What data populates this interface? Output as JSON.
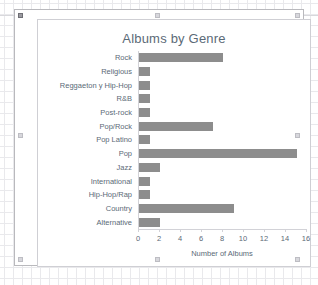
{
  "chart_data": {
    "type": "bar",
    "orientation": "horizontal",
    "title": "Albums by Genre",
    "xlabel": "Number of Albums",
    "ylabel": "",
    "categories": [
      "Rock",
      "Religious",
      "Reggaeton y Hip-Hop",
      "R&B",
      "Post-rock",
      "Pop/Rock",
      "Pop Latino",
      "Pop",
      "Jazz",
      "International",
      "Hip-Hop/Rap",
      "Country",
      "Alternative"
    ],
    "values": [
      8,
      1,
      1,
      1,
      1,
      7,
      1,
      15,
      2,
      1,
      1,
      9,
      2
    ],
    "xticks": [
      "0",
      "2",
      "4",
      "6",
      "8",
      "10",
      "12",
      "14",
      "16"
    ],
    "xtick_values": [
      0,
      2,
      4,
      6,
      8,
      10,
      12,
      14,
      16
    ],
    "xlim": [
      0,
      16
    ],
    "grid": false,
    "legend": false,
    "bar_color": "#8d8d8d",
    "text_color": "#5b6a77",
    "axis_color": "#d2d2d7"
  },
  "chart_object": {
    "state": "selected",
    "handles": [
      "top-left",
      "top-center",
      "top-right",
      "middle-left",
      "middle-right",
      "bottom-left",
      "bottom-center",
      "bottom-right"
    ]
  }
}
